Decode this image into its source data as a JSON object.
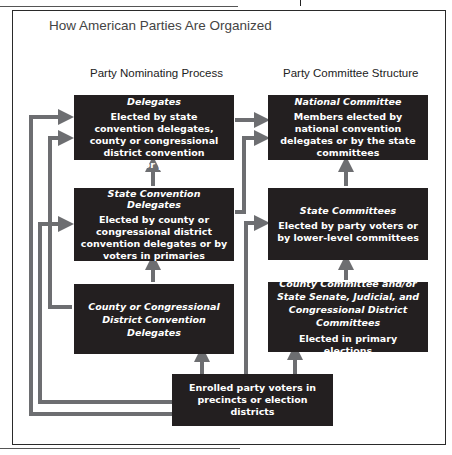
{
  "title": "How American Parties Are Organized",
  "columns": {
    "left": "Party Nominating Process",
    "right": "Party Committee Structure"
  },
  "nominating": [
    {
      "heading": "National Convention Delegates",
      "body": "Elected by state convention delegates, county or congressional district convention delegates, or party voters"
    },
    {
      "heading": "State Convention Delegates",
      "body": "Elected by county or congressional district convention delegates or by voters in primaries"
    },
    {
      "heading": "County or Congressional District Convention Delegates",
      "body": ""
    }
  ],
  "committee": [
    {
      "heading": "National Committee",
      "body": "Members elected by national convention delegates or by the state committees"
    },
    {
      "heading": "State Committees",
      "body": "Elected by party voters or by lower-level committees"
    },
    {
      "heading": "County Committee and/or State Senate, Judicial, and Congressional District Committees",
      "body": "Elected in primary elections"
    }
  ],
  "base": {
    "body": "Enrolled party voters in precincts or election districts"
  },
  "colors": {
    "box": "#231f20",
    "arrow": "#6d6e71",
    "text": "#ffffff"
  }
}
